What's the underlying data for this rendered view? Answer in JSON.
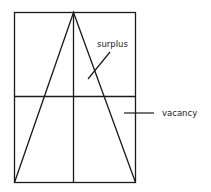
{
  "diagram": {
    "labels": {
      "surplus": "surplus",
      "vacancy": "vacancy"
    },
    "colors": {
      "stroke": "#1a1a1a",
      "background": "#ffffff"
    }
  }
}
